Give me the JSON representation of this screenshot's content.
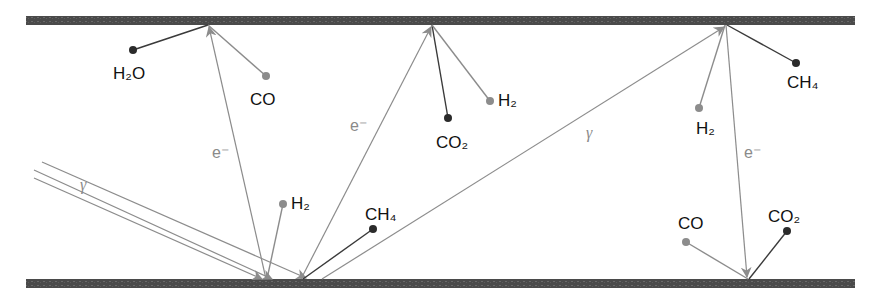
{
  "diagram": {
    "title": "",
    "colors": {
      "plate": "#4a4a4a",
      "dark_line": "#3a3a3a",
      "grey_line": "#8c8c8c",
      "dark_dot": "#2b2b2b",
      "grey_dot": "#8c8c8c",
      "text": "#111111",
      "grey_text": "#8a8a8a"
    },
    "plates": [
      {
        "id": "top-plate",
        "x1": 26,
        "x2": 855,
        "y": 16,
        "height": 9
      },
      {
        "id": "bottom-plate",
        "x1": 26,
        "x2": 855,
        "y": 279,
        "height": 9
      }
    ],
    "beams": {
      "gamma_label_left": "γ",
      "gamma_label_right": "γ",
      "electron_label": "e⁻"
    },
    "labels": {
      "h2o": "H₂O",
      "co_top": "CO",
      "co2_top": "CO₂",
      "h2_top": "H₂",
      "h2_right": "H₂",
      "ch4_right": "CH₄",
      "h2_bottom": "H₂",
      "ch4_bottom": "CH₄",
      "co_bottom": "CO",
      "co2_bottom": "CO₂",
      "e1": "e⁻",
      "e2": "e⁻",
      "e3": "e⁻"
    },
    "nodes": [
      {
        "name": "h2o-molecule",
        "x": 133,
        "y": 50,
        "shade": "dark"
      },
      {
        "name": "co-molecule-top",
        "x": 266,
        "y": 76,
        "shade": "grey"
      },
      {
        "name": "co2-molecule-top",
        "x": 448,
        "y": 118,
        "shade": "dark"
      },
      {
        "name": "h2-molecule-top",
        "x": 490,
        "y": 101,
        "shade": "grey"
      },
      {
        "name": "h2-molecule-right",
        "x": 699,
        "y": 108,
        "shade": "grey"
      },
      {
        "name": "ch4-molecule-right",
        "x": 796,
        "y": 63,
        "shade": "dark"
      },
      {
        "name": "h2-molecule-bottom",
        "x": 283,
        "y": 204,
        "shade": "grey"
      },
      {
        "name": "ch4-molecule-bottom",
        "x": 373,
        "y": 229,
        "shade": "dark"
      },
      {
        "name": "co-molecule-bottom",
        "x": 686,
        "y": 242,
        "shade": "grey"
      },
      {
        "name": "co2-molecule-bottom",
        "x": 787,
        "y": 231,
        "shade": "dark"
      }
    ]
  }
}
